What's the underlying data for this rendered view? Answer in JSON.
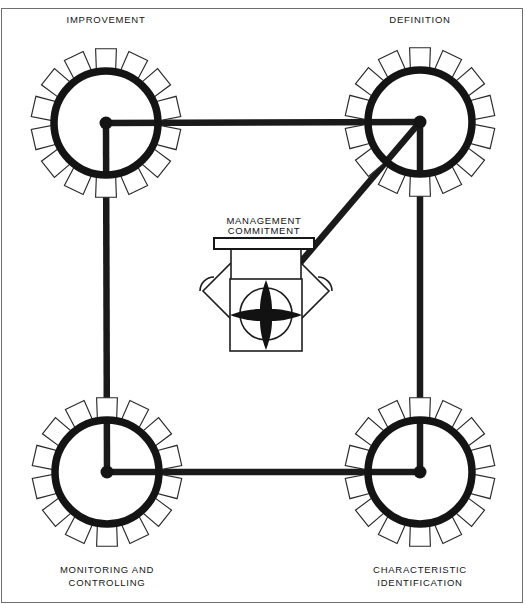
{
  "page": {
    "background_color": "#ffffff",
    "ink_color": "#141414",
    "width": 525,
    "height": 604
  },
  "top_cropped_caption": "",
  "nodes": [
    {
      "id": "improvement",
      "label": "IMPROVEMENT",
      "label_lines": [
        "IMPROVEMENT"
      ],
      "position": "top-left",
      "hub": {
        "x": 106,
        "y": 123
      },
      "radius": 52,
      "teeth": 14,
      "label_x": 106,
      "label_y": 23
    },
    {
      "id": "definition",
      "label": "DEFINITION",
      "label_lines": [
        "DEFINITION"
      ],
      "position": "top-right",
      "hub": {
        "x": 420,
        "y": 122
      },
      "radius": 52,
      "teeth": 14,
      "label_x": 420,
      "label_y": 23
    },
    {
      "id": "monitoring-and-controlling",
      "label": "MONITORING AND CONTROLLING",
      "label_lines": [
        "MONITORING AND",
        "CONTROLLING"
      ],
      "position": "bottom-left",
      "hub": {
        "x": 107,
        "y": 472
      },
      "radius": 52,
      "teeth": 14,
      "label_x": 107,
      "label_y": 573
    },
    {
      "id": "characteristic-identification",
      "label": "CHARACTERISTIC IDENTIFICATION",
      "label_lines": [
        "CHARACTERISTIC",
        "IDENTIFICATION"
      ],
      "position": "bottom-right",
      "hub": {
        "x": 420,
        "y": 472
      },
      "radius": 52,
      "teeth": 14,
      "label_x": 420,
      "label_y": 573
    }
  ],
  "center": {
    "id": "management-commitment",
    "label_lines": [
      "MANAGEMENT",
      "COMMITMENT"
    ],
    "label_line_1": "MANAGEMENT",
    "label_line_2": "COMMITMENT",
    "label_x": 264,
    "label_y_1": 224,
    "label_y_2": 234,
    "crossbar": {
      "x": 214,
      "y": 238,
      "width": 100,
      "height": 11
    },
    "body": {
      "x": 230,
      "y": 279,
      "width": 72,
      "height": 72
    },
    "rotor_center": {
      "x": 266,
      "y": 314
    },
    "rotor_circle_radius": 26
  },
  "linkages": [
    {
      "id": "top-bar",
      "from": "improvement",
      "to": "definition"
    },
    {
      "id": "left-bar",
      "from": "improvement",
      "to": "monitoring-and-controlling"
    },
    {
      "id": "bottom-bar",
      "from": "monitoring-and-controlling",
      "to": "characteristic-identification"
    },
    {
      "id": "right-bar",
      "from": "definition",
      "to": "characteristic-identification"
    },
    {
      "id": "drive-arm",
      "from": "definition",
      "to": "management-commitment"
    }
  ],
  "chart_data": {
    "type": "diagram",
    "nodes": [
      "IMPROVEMENT",
      "DEFINITION",
      "CHARACTERISTIC IDENTIFICATION",
      "MONITORING AND CONTROLLING",
      "MANAGEMENT COMMITMENT"
    ],
    "edges": [
      [
        "IMPROVEMENT",
        "DEFINITION"
      ],
      [
        "DEFINITION",
        "CHARACTERISTIC IDENTIFICATION"
      ],
      [
        "CHARACTERISTIC IDENTIFICATION",
        "MONITORING AND CONTROLLING"
      ],
      [
        "MONITORING AND CONTROLLING",
        "IMPROVEMENT"
      ],
      [
        "DEFINITION",
        "MANAGEMENT COMMITMENT"
      ]
    ],
    "node_shape": "gear",
    "gear_teeth_per_node": 14,
    "legend": []
  }
}
